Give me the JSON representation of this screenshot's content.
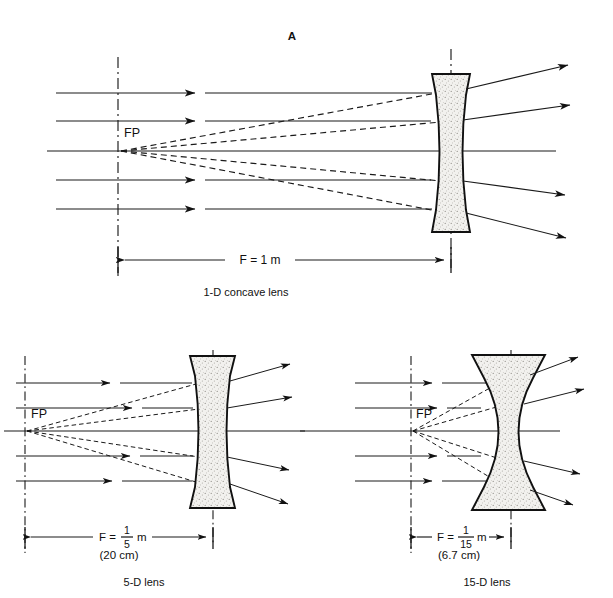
{
  "figure": {
    "panel_label": "A",
    "background_color": "#ffffff",
    "ink_color": "#111111"
  },
  "panels": [
    {
      "id": "top",
      "caption": "1-D concave lens",
      "focal_point_label": "FP",
      "dimension": {
        "text": "F = 1 m",
        "has_fraction": false,
        "secondary_text": ""
      },
      "power": "1-D",
      "focal_length_m": 1,
      "ray_count": 5
    },
    {
      "id": "bottom-left",
      "caption": "5-D lens",
      "focal_point_label": "FP",
      "dimension": {
        "text": "F =",
        "has_fraction": true,
        "numerator": "1",
        "denominator": "5",
        "unit": "m",
        "secondary_text": "(20 cm)"
      },
      "power": "5-D",
      "focal_length_m": 0.2,
      "ray_count": 5
    },
    {
      "id": "bottom-right",
      "caption": "15-D lens",
      "focal_point_label": "FP",
      "dimension": {
        "text": "F =",
        "has_fraction": true,
        "numerator": "1",
        "denominator": "15",
        "unit": "m",
        "secondary_text": "(6.7 cm)"
      },
      "power": "15-D",
      "focal_length_m": 0.067,
      "ray_count": 5
    }
  ]
}
